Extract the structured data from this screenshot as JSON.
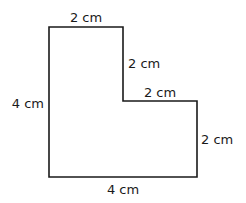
{
  "diagram": {
    "type": "L-shaped polygon",
    "stroke_color": "#1a1a1a",
    "labels": {
      "top": "2 cm",
      "inner_vertical": "2 cm",
      "inner_horizontal": "2 cm",
      "right": "2 cm",
      "bottom": "4 cm",
      "left": "4 cm"
    }
  }
}
